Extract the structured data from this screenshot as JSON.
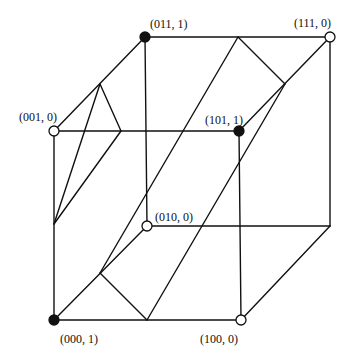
{
  "diagram": {
    "type": "hypercube-vertex-labeling",
    "colors": {
      "line": "#111111",
      "filled": "#111111",
      "open": "#ffffff",
      "background": "#ffffff"
    },
    "vertices": [
      {
        "id": "000",
        "label": "(000, 1)",
        "value": 1,
        "x": 54,
        "y": 320,
        "lx": 60,
        "ly": 343
      },
      {
        "id": "100",
        "label": "(100, 0)",
        "value": 0,
        "x": 241,
        "y": 320,
        "lx": 200,
        "ly": 343
      },
      {
        "id": "010",
        "label": "(010, 0)",
        "value": 0,
        "x": 147,
        "y": 226,
        "lx": 155,
        "ly": 221
      },
      {
        "id": "001",
        "label": "(001, 0)",
        "value": 0,
        "x": 54,
        "y": 131,
        "lx": 19,
        "ly": 121
      },
      {
        "id": "101",
        "label": "(101, 1)",
        "value": 1,
        "x": 239,
        "y": 131,
        "lx": 205,
        "ly": 124
      },
      {
        "id": "011",
        "label": "(011, 1)",
        "value": 1,
        "x": 145,
        "y": 37,
        "lx": 150,
        "ly": 28
      },
      {
        "id": "111",
        "label": "(111, 0)",
        "value": 0,
        "x": 330,
        "y": 37,
        "lx": 294,
        "ly": 27
      },
      {
        "id": "110",
        "label": "",
        "value": null,
        "x": 330,
        "y": 226,
        "lx": 0,
        "ly": 0
      }
    ],
    "edges": [
      [
        "000",
        "100"
      ],
      [
        "000",
        "010"
      ],
      [
        "000",
        "001"
      ],
      [
        "100",
        "110"
      ],
      [
        "100",
        "101"
      ],
      [
        "010",
        "110"
      ],
      [
        "010",
        "011"
      ],
      [
        "001",
        "101"
      ],
      [
        "001",
        "011"
      ],
      [
        "101",
        "111"
      ],
      [
        "011",
        "111"
      ],
      [
        "110",
        "111"
      ]
    ],
    "separating_lines": [
      {
        "from": [
          100,
          84
        ],
        "to": [
          121,
          131
        ]
      },
      {
        "from": [
          100,
          84
        ],
        "to": [
          54,
          224
        ]
      },
      {
        "from": [
          121,
          131
        ],
        "to": [
          54,
          224
        ]
      },
      {
        "from": [
          238,
          37
        ],
        "to": [
          285,
          84
        ]
      },
      {
        "from": [
          238,
          37
        ],
        "to": [
          100,
          273
        ]
      },
      {
        "from": [
          285,
          84
        ],
        "to": [
          147,
          320
        ]
      },
      {
        "from": [
          100,
          273
        ],
        "to": [
          147,
          320
        ]
      }
    ]
  }
}
